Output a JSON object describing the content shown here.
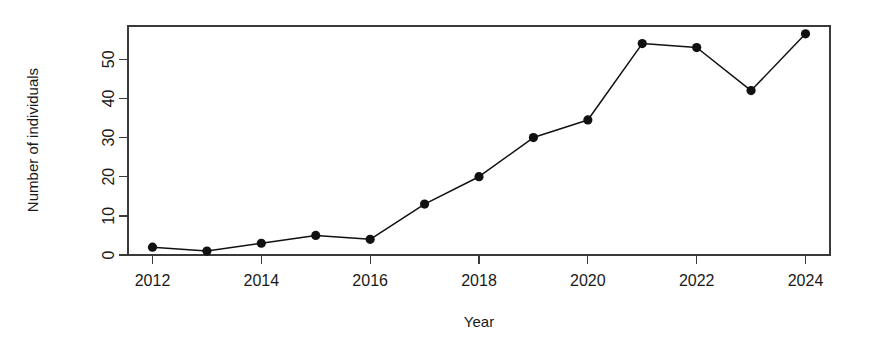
{
  "figure": {
    "background": "#ffffff",
    "foreground": "#111111",
    "width": 878,
    "height": 357
  },
  "chart_data": {
    "type": "line",
    "title": "",
    "subtitle": "",
    "xlabel": "Year",
    "ylabel": "Number of individuals",
    "x": [
      2012,
      2013,
      2014,
      2015,
      2016,
      2017,
      2018,
      2019,
      2020,
      2021,
      2022,
      2023,
      2024
    ],
    "values": [
      2,
      1,
      3,
      5,
      4,
      13,
      20,
      30,
      34.5,
      54,
      53,
      42,
      56.5
    ],
    "series": [
      {
        "name": "Number of individuals",
        "values": [
          2,
          1,
          3,
          5,
          4,
          13,
          20,
          30,
          34.5,
          54,
          53,
          42,
          56.5
        ],
        "color": "#111111",
        "marker": "filled-circle",
        "line_style": "solid"
      }
    ],
    "xlim": [
      2011.55,
      2024.45
    ],
    "ylim": [
      0,
      58.5
    ],
    "xticks": [
      2012,
      2014,
      2016,
      2018,
      2020,
      2022,
      2024
    ],
    "xticklabels": [
      "2012",
      "2014",
      "2016",
      "2018",
      "2020",
      "2022",
      "2024"
    ],
    "yticks": [
      0,
      10,
      20,
      30,
      40,
      50
    ],
    "yticklabels": [
      "0",
      "10",
      "20",
      "30",
      "40",
      "50"
    ],
    "ytick_label_rotation": 90,
    "grid": false,
    "legend": false,
    "legend_position": "none",
    "frame": "box",
    "annotations": []
  }
}
